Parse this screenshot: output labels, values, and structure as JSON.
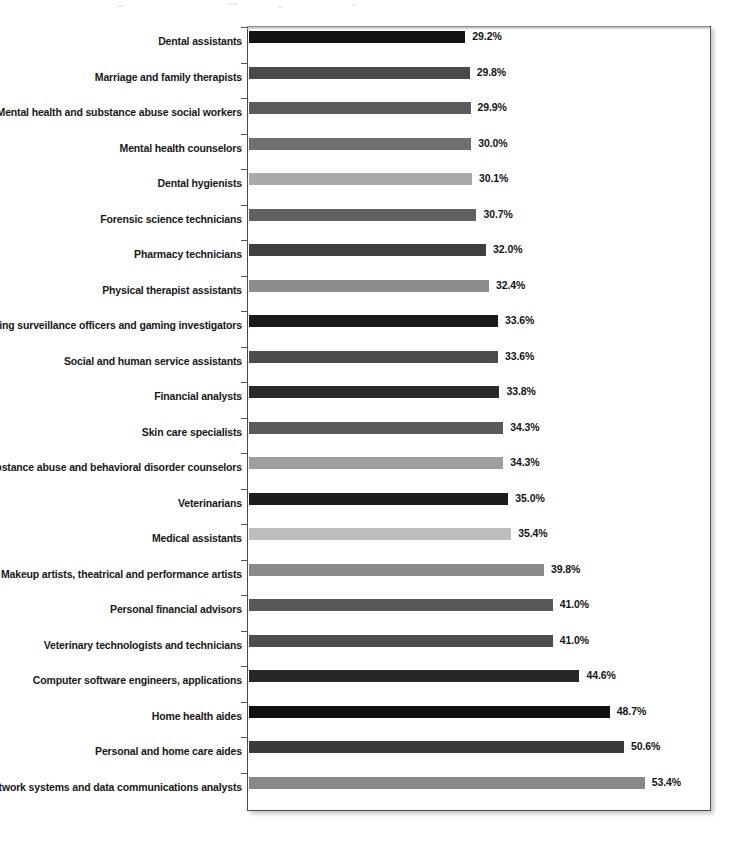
{
  "chart_data": {
    "type": "bar",
    "orientation": "horizontal",
    "title": "",
    "xlabel": "",
    "ylabel": "",
    "value_suffix": "%",
    "grid": false,
    "legend": "none",
    "xlim": [
      0,
      56
    ],
    "axis_visible": {
      "left_spine": true,
      "frame": true,
      "tick_labels": false
    },
    "categories": [
      "Dental assistants",
      "Marriage and family therapists",
      "Mental health and substance abuse social workers",
      "Mental health counselors",
      "Dental hygienists",
      "Forensic science technicians",
      "Pharmacy technicians",
      "Physical therapist assistants",
      "Gaming surveillance officers and gaming investigators",
      "Social and human service assistants",
      "Financial analysts",
      "Skin care specialists",
      "Substance abuse and behavioral disorder counselors",
      "Veterinarians",
      "Medical assistants",
      "Makeup artists, theatrical and performance artists",
      "Personal financial advisors",
      "Veterinary technologists and technicians",
      "Computer software engineers, applications",
      "Home health aides",
      "Personal and home care aides",
      "Network systems and data communications analysts"
    ],
    "values": [
      29.2,
      29.8,
      29.9,
      30.0,
      30.1,
      30.7,
      32.0,
      32.4,
      33.6,
      33.6,
      33.8,
      34.3,
      34.3,
      35.0,
      35.4,
      39.8,
      41.0,
      41.0,
      44.6,
      48.7,
      50.6,
      53.4
    ],
    "value_labels": [
      "29.2%",
      "29.8%",
      "29.9%",
      "30.0%",
      "30.1%",
      "30.7%",
      "32.0%",
      "32.4%",
      "33.6%",
      "33.6%",
      "33.8%",
      "34.3%",
      "34.3%",
      "35.0%",
      "35.4%",
      "39.8%",
      "41.0%",
      "41.0%",
      "44.6%",
      "48.7%",
      "50.6%",
      "53.4%"
    ],
    "bar_colors": [
      "#131313",
      "#4a4a4a",
      "#5c5c5c",
      "#6e6e6e",
      "#a9a9a9",
      "#606060",
      "#3f3f3f",
      "#8d8d8d",
      "#1a1a1a",
      "#4d4d4d",
      "#2a2a2a",
      "#595959",
      "#9e9e9e",
      "#1d1d1d",
      "#bdbdbd",
      "#8a8a8a",
      "#585858",
      "#4e4e4e",
      "#272727",
      "#101010",
      "#3a3a3a",
      "#888888"
    ]
  }
}
